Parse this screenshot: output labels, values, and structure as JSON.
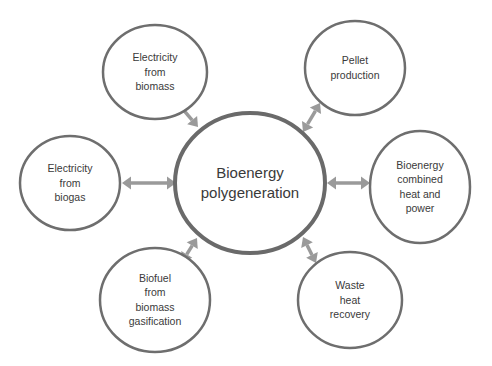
{
  "diagram": {
    "type": "hub-and-spoke",
    "colors": {
      "node_stroke": "#6e6e6e",
      "arrow": "#9a9a9a",
      "text": "#3a3a3a",
      "background": "#ffffff"
    },
    "hub": {
      "id": "bioenergy-polygeneration",
      "lines": [
        "Bioenergy",
        "polygeneration"
      ]
    },
    "nodes": [
      {
        "id": "electricity-from-biomass",
        "lines": [
          "Electricity",
          "from",
          "biomass"
        ],
        "position": "top-left"
      },
      {
        "id": "pellet-production",
        "lines": [
          "Pellet",
          "production"
        ],
        "position": "top-right"
      },
      {
        "id": "electricity-from-biogas",
        "lines": [
          "Electricity",
          "from",
          "biogas"
        ],
        "position": "left"
      },
      {
        "id": "bioenergy-chp",
        "lines": [
          "Bioenergy",
          "combined",
          "heat and",
          "power"
        ],
        "position": "right"
      },
      {
        "id": "biofuel-from-biomass-gasification",
        "lines": [
          "Biofuel",
          "from",
          "biomass",
          "gasification"
        ],
        "position": "bottom-left"
      },
      {
        "id": "waste-heat-recovery",
        "lines": [
          "Waste",
          "heat",
          "recovery"
        ],
        "position": "bottom-right"
      }
    ],
    "edges": [
      {
        "from": "bioenergy-polygeneration",
        "to": "electricity-from-biomass",
        "direction": "bidirectional"
      },
      {
        "from": "bioenergy-polygeneration",
        "to": "pellet-production",
        "direction": "bidirectional"
      },
      {
        "from": "bioenergy-polygeneration",
        "to": "electricity-from-biogas",
        "direction": "bidirectional"
      },
      {
        "from": "bioenergy-polygeneration",
        "to": "bioenergy-chp",
        "direction": "bidirectional"
      },
      {
        "from": "bioenergy-polygeneration",
        "to": "biofuel-from-biomass-gasification",
        "direction": "bidirectional"
      },
      {
        "from": "bioenergy-polygeneration",
        "to": "waste-heat-recovery",
        "direction": "bidirectional"
      }
    ]
  }
}
